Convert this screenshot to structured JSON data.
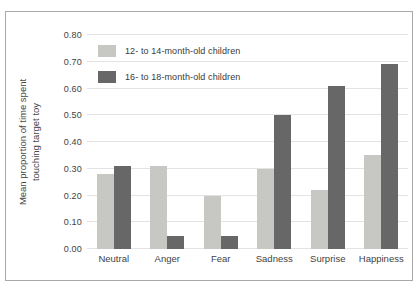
{
  "figure": {
    "ylabel_line1": "Mean proportion of time spent",
    "ylabel_line2": "touching target toy"
  },
  "chart_data": {
    "type": "bar",
    "title": "",
    "xlabel": "",
    "ylabel": "Mean proportion of time spent touching target toy",
    "categories": [
      "Neutral",
      "Anger",
      "Fear",
      "Sadness",
      "Surprise",
      "Happiness"
    ],
    "series": [
      {
        "name": "12- to 14-month-old children",
        "color": "#c7c8c3",
        "values": [
          0.28,
          0.31,
          0.2,
          0.3,
          0.22,
          0.35
        ]
      },
      {
        "name": "16- to 18-month-old children",
        "color": "#676767",
        "values": [
          0.31,
          0.05,
          0.05,
          0.5,
          0.61,
          0.69
        ]
      }
    ],
    "ylim": [
      0,
      0.8
    ],
    "ytick_values": [
      0.0,
      0.1,
      0.2,
      0.3,
      0.4,
      0.5,
      0.6,
      0.7,
      0.8
    ],
    "ytick_labels": [
      "0.00",
      "0.10",
      "0.20",
      "0.30",
      "0.40",
      "0.50",
      "0.60",
      "0.70",
      "0.80"
    ],
    "grid": "horizontal",
    "legend_position": "top-left-inside"
  },
  "colors": {
    "gridline": "#e3e3e3",
    "border": "#a9a9a9",
    "text": "#3f3f3f",
    "background": "#ffffff"
  }
}
